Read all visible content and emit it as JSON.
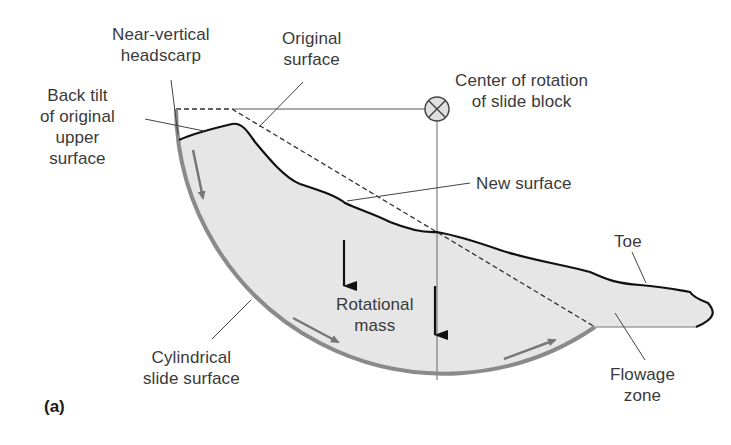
{
  "figure": {
    "panel_label": "(a)"
  },
  "labels": {
    "headscarp": [
      "Near-vertical",
      "headscarp"
    ],
    "original_surface": [
      "Original",
      "surface"
    ],
    "back_tilt": [
      "Back tilt",
      "of original",
      "upper",
      "surface"
    ],
    "center_of_rotation": [
      "Center of rotation",
      "of slide block"
    ],
    "new_surface": [
      "New surface"
    ],
    "toe": [
      "Toe"
    ],
    "rotational_mass": [
      "Rotational",
      "mass"
    ],
    "cylindrical_slide_surface": [
      "Cylindrical",
      "slide surface"
    ],
    "flowage_zone": [
      "Flowage",
      "zone"
    ]
  },
  "colors": {
    "slide_fill": "#e6e6e6",
    "slide_surface_stroke": "#8a8a8a",
    "new_surface_stroke": "#111111",
    "leader_line": "#555555",
    "text": "#3a3a3a",
    "motion_arrow_gray": "#777777",
    "motion_arrow_black": "#111111"
  },
  "icons": {
    "center_of_rotation_symbol": "circle-x-icon"
  }
}
